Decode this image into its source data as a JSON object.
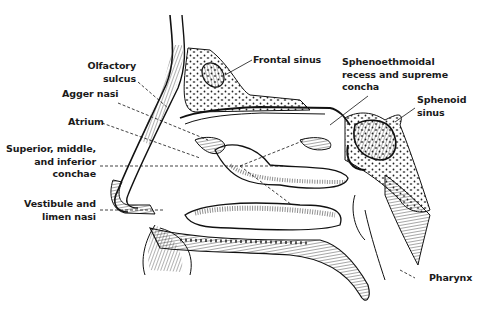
{
  "figure": {
    "labels": [
      {
        "id": "olfactory_sulcus",
        "lines": [
          "Olfactory",
          "sulcus"
        ]
      },
      {
        "id": "agger_nasi",
        "lines": [
          "Agger nasi"
        ]
      },
      {
        "id": "atrium",
        "lines": [
          "Atrium"
        ]
      },
      {
        "id": "conchae",
        "lines": [
          "Superior, middle,",
          "and inferior",
          "conchae"
        ]
      },
      {
        "id": "vestibule",
        "lines": [
          "Vestibule and",
          "limen nasi"
        ]
      },
      {
        "id": "frontal_sinus",
        "lines": [
          "Frontal sinus"
        ]
      },
      {
        "id": "sphenoethmoidal",
        "lines": [
          "Sphenoethmoidal",
          "recess and supreme",
          "concha"
        ]
      },
      {
        "id": "sphenoid_sinus",
        "lines": [
          "Sphenoid",
          "sinus"
        ]
      },
      {
        "id": "pharynx",
        "lines": [
          "Pharynx"
        ]
      }
    ]
  },
  "colors": {
    "ink": "#1a1a1a",
    "background": "#ffffff"
  }
}
